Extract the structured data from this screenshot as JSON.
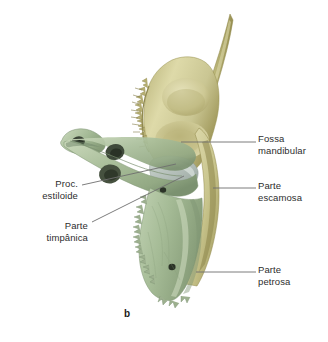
{
  "figure": {
    "caption": "b",
    "background_color": "#ffffff",
    "text_color": "#2d2d2d",
    "leader_line_color": "#6e6e6e"
  },
  "palette": {
    "squamous_bone": "#c9c68a",
    "squamous_bone_light": "#ddd9a8",
    "squamous_bone_dark": "#9a9257",
    "petrous_bone": "#a8bd9a",
    "petrous_bone_light": "#c3d3b4",
    "petrous_bone_dark": "#7d9470",
    "tympanic_plate": "#b8c3bd",
    "foramen": "#30362c"
  },
  "labels": [
    {
      "id": "fossa-mandibular",
      "text": "Fossa\nmandibular",
      "side": "right",
      "target": "mandibular fossa"
    },
    {
      "id": "parte-escamosa",
      "text": "Parte\nescamosa",
      "side": "right",
      "target": "squamous part"
    },
    {
      "id": "parte-petrosa",
      "text": "Parte\npetrosa",
      "side": "right",
      "target": "petrous part"
    },
    {
      "id": "proc-estiloide",
      "text": "Proc.\nestiloide",
      "side": "left",
      "target": "styloid process"
    },
    {
      "id": "parte-timpanica",
      "text": "Parte\ntimpânica",
      "side": "left",
      "target": "tympanic part"
    }
  ]
}
